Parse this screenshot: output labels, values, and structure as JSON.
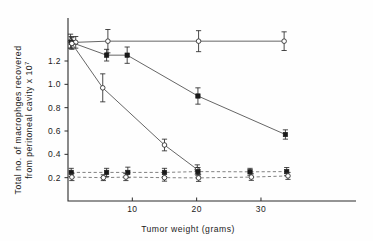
{
  "chart_data": {
    "type": "scatter",
    "title": "",
    "xlabel": "Tumor weight (grams)",
    "ylabel_line1": "Total no. of macrophges recovered",
    "ylabel_line2": "from peritoneal cavity x 10",
    "ylabel_exponent": "7",
    "xlim": [
      0,
      37
    ],
    "ylim": [
      0,
      1.5
    ],
    "xticks": [
      10,
      20,
      30
    ],
    "xticklabels": [
      "10",
      "20",
      "30"
    ],
    "yticks": [
      0.2,
      0.4,
      0.6,
      0.8,
      1.0,
      1.2
    ],
    "yticklabels": [
      "0.2",
      "0.4",
      "0.6",
      "0.8",
      "1.0",
      "1.2"
    ],
    "grid": false,
    "legend": "none",
    "series": [
      {
        "name": "control-flat-top",
        "marker": "open-circle",
        "linestyle": "solid",
        "points": [
          {
            "x": 0.4,
            "y": 1.37,
            "err": 0.06
          },
          {
            "x": 1.2,
            "y": 1.36,
            "err": 0.05
          },
          {
            "x": 6.2,
            "y": 1.37,
            "err": 0.1
          },
          {
            "x": 20.3,
            "y": 1.37,
            "err": 0.09
          },
          {
            "x": 33.6,
            "y": 1.37,
            "err": 0.08
          }
        ]
      },
      {
        "name": "moderate-decline",
        "marker": "filled-square",
        "linestyle": "solid",
        "points": [
          {
            "x": 0.5,
            "y": 1.36,
            "err": 0.05
          },
          {
            "x": 6.0,
            "y": 1.25,
            "err": 0.05
          },
          {
            "x": 9.2,
            "y": 1.25,
            "err": 0.07
          },
          {
            "x": 20.2,
            "y": 0.9,
            "err": 0.07
          },
          {
            "x": 33.8,
            "y": 0.57,
            "err": 0.04
          }
        ]
      },
      {
        "name": "steep-decline",
        "marker": "open-circle",
        "linestyle": "solid",
        "points": [
          {
            "x": 0.6,
            "y": 1.35,
            "err": 0.05
          },
          {
            "x": 5.4,
            "y": 0.97,
            "err": 0.12
          },
          {
            "x": 15.0,
            "y": 0.48,
            "err": 0.05
          },
          {
            "x": 20.1,
            "y": 0.27,
            "err": 0.04
          }
        ]
      },
      {
        "name": "baseline-upper-dashed",
        "marker": "filled-square",
        "linestyle": "dashed",
        "points": [
          {
            "x": 0.5,
            "y": 0.245,
            "err": 0.035
          },
          {
            "x": 6.0,
            "y": 0.245,
            "err": 0.035
          },
          {
            "x": 9.3,
            "y": 0.245,
            "err": 0.045
          },
          {
            "x": 15.0,
            "y": 0.245,
            "err": 0.035
          },
          {
            "x": 20.2,
            "y": 0.252,
            "err": 0.035
          },
          {
            "x": 28.3,
            "y": 0.25,
            "err": 0.03
          },
          {
            "x": 34.0,
            "y": 0.252,
            "err": 0.035
          }
        ]
      },
      {
        "name": "baseline-lower-dashed",
        "marker": "open-circle",
        "linestyle": "dashed",
        "points": [
          {
            "x": 0.6,
            "y": 0.205,
            "err": 0.03
          },
          {
            "x": 5.5,
            "y": 0.2,
            "err": 0.025
          },
          {
            "x": 9.0,
            "y": 0.205,
            "err": 0.03
          },
          {
            "x": 15.0,
            "y": 0.2,
            "err": 0.03
          },
          {
            "x": 20.3,
            "y": 0.198,
            "err": 0.03
          },
          {
            "x": 28.5,
            "y": 0.205,
            "err": 0.028
          },
          {
            "x": 34.2,
            "y": 0.215,
            "err": 0.03
          }
        ]
      }
    ]
  },
  "figure": {
    "background_color": "#fefefe",
    "ink_color": "#1b1b1b",
    "line_color": "#4a4a4a"
  }
}
